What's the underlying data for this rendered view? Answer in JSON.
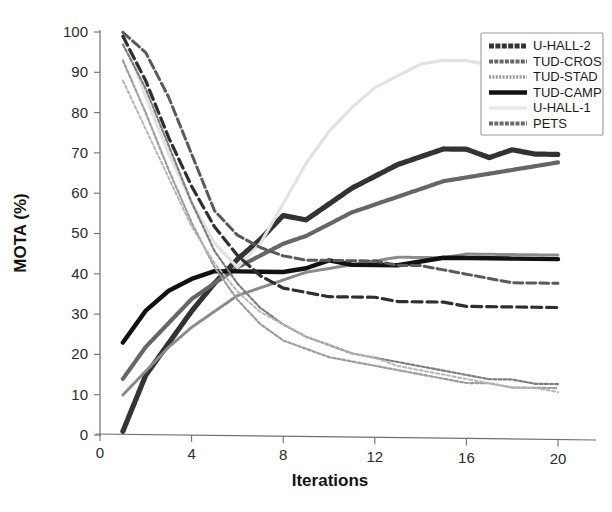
{
  "chart_data": {
    "type": "line",
    "title": "",
    "xlabel": "Iterations",
    "ylabel": "MOTA (%)",
    "xlim": [
      0,
      21
    ],
    "ylim": [
      0,
      100
    ],
    "xticks": [
      0,
      4,
      8,
      12,
      16,
      20
    ],
    "yticks": [
      0,
      10,
      20,
      30,
      40,
      50,
      60,
      70,
      80,
      90,
      100
    ],
    "grid": false,
    "legend_position": "upper right",
    "x": [
      1,
      2,
      3,
      4,
      5,
      6,
      7,
      8,
      9,
      10,
      11,
      12,
      13,
      14,
      15,
      16,
      17,
      18,
      19,
      20
    ],
    "series": [
      {
        "name": "U-HALL-2",
        "color": "#333333",
        "style": "thick-textured",
        "values": [
          1,
          15,
          23,
          31,
          38,
          44,
          49,
          55,
          54,
          58,
          62,
          65,
          68,
          70,
          72,
          72,
          70,
          72,
          71,
          71
        ]
      },
      {
        "name": "TUD-CROS",
        "color": "#666666",
        "style": "medium-textured",
        "values": [
          14,
          22,
          28,
          34,
          38,
          42,
          45,
          48,
          50,
          53,
          56,
          58,
          60,
          62,
          64,
          65,
          66,
          67,
          68,
          69
        ]
      },
      {
        "name": "TUD-STAD",
        "color": "#8a8a8a",
        "style": "thin-dotted",
        "values": [
          10,
          16,
          22,
          27,
          31,
          35,
          37,
          39,
          41,
          42,
          43,
          44,
          45,
          45,
          45,
          46,
          46,
          46,
          46,
          46
        ]
      },
      {
        "name": "TUD-CAMP",
        "color": "#111111",
        "style": "solid-thick",
        "values": [
          23,
          31,
          36,
          39,
          41,
          41,
          41,
          41,
          42,
          44,
          43,
          43,
          43,
          44,
          45,
          45,
          45,
          45,
          45,
          45
        ]
      },
      {
        "name": "U-HALL-1",
        "color": "#e2e2e2",
        "style": "very-light",
        "values": [
          100,
          84,
          70,
          58,
          48,
          42,
          48,
          58,
          68,
          76,
          82,
          87,
          90,
          93,
          94,
          94,
          93,
          92,
          91,
          90
        ]
      },
      {
        "name": "PETS",
        "color": "#5a5a5a",
        "style": "dashed",
        "values": [
          100,
          95,
          84,
          70,
          56,
          50,
          47,
          45,
          44,
          44,
          44,
          44,
          43,
          43,
          42,
          41,
          40,
          39,
          39,
          39
        ]
      },
      {
        "name": "decline-a",
        "color": "#2f2f2f",
        "style": "dashed-dark",
        "values": [
          99,
          88,
          74,
          62,
          52,
          45,
          40,
          37,
          36,
          35,
          35,
          35,
          34,
          34,
          34,
          33,
          33,
          33,
          33,
          33
        ]
      },
      {
        "name": "decline-b",
        "color": "#7d7d7d",
        "style": "dotted-fine",
        "values": [
          97,
          86,
          72,
          58,
          46,
          38,
          32,
          28,
          25,
          23,
          21,
          20,
          19,
          18,
          17,
          16,
          15,
          15,
          14,
          14
        ]
      },
      {
        "name": "decline-c",
        "color": "#9c9c9c",
        "style": "dotted-fine",
        "values": [
          93,
          80,
          66,
          53,
          42,
          34,
          28,
          24,
          22,
          20,
          19,
          18,
          17,
          16,
          15,
          14,
          14,
          13,
          13,
          13
        ]
      },
      {
        "name": "decline-d",
        "color": "#b5b5b5",
        "style": "dotted-faint",
        "values": [
          88,
          76,
          64,
          52,
          43,
          36,
          31,
          28,
          25,
          23,
          21,
          20,
          18,
          17,
          16,
          15,
          14,
          13,
          13,
          12
        ]
      }
    ],
    "legend_entries": [
      {
        "label": "U-HALL-2",
        "color": "#333333",
        "swatch": "thick-textured"
      },
      {
        "label": "TUD-CROS",
        "color": "#666666",
        "swatch": "medium-textured"
      },
      {
        "label": "TUD-STAD",
        "color": "#9b9b9b",
        "swatch": "thin-dotted"
      },
      {
        "label": "TUD-CAMP",
        "color": "#111111",
        "swatch": "solid-thick"
      },
      {
        "label": "U-HALL-1",
        "color": "#e8e8e8",
        "swatch": "very-light"
      },
      {
        "label": "PETS",
        "color": "#6b6b6b",
        "swatch": "medium-textured"
      }
    ]
  }
}
